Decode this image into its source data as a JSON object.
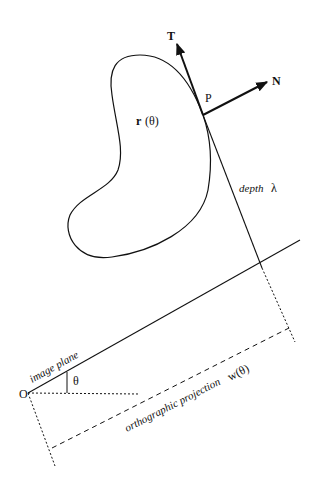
{
  "diagram": {
    "labels": {
      "tangent": "T",
      "normal": "N",
      "point": "P",
      "r_bold": "r",
      "r_arg": "(θ)",
      "depth_word": "depth",
      "depth_symbol": "λ",
      "image_plane": "image plane",
      "theta": "θ",
      "origin": "O",
      "projection": "orthographic projection",
      "projection_symbol": "w(θ)"
    },
    "colors": {
      "stroke": "#111111",
      "background": "#ffffff"
    }
  }
}
